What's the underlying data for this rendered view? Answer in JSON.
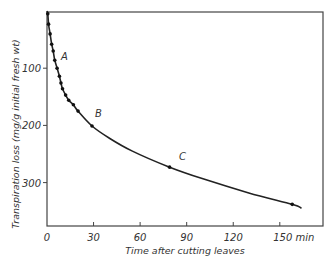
{
  "chart_data": {
    "type": "line",
    "title": "",
    "xlabel": "Time after cutting leaves",
    "ylabel": "Transpiration loss (mg/g  initial fresh wt)",
    "x_unit": "min",
    "xlim": [
      0,
      165
    ],
    "ylim": [
      0,
      355
    ],
    "y_inverted": true,
    "grid": false,
    "legend": null,
    "x_ticks": [
      0,
      30,
      60,
      90,
      120,
      150
    ],
    "x_tick_labels": [
      "0",
      "30",
      "60",
      "90",
      "120",
      "150 min"
    ],
    "y_ticks": [
      100,
      200,
      300
    ],
    "y_tick_labels": [
      "100",
      "200",
      "300"
    ],
    "series": [
      {
        "name": "Transpiration loss",
        "x": [
          0,
          0.5,
          1,
          2,
          3,
          4,
          5,
          6.5,
          8,
          9,
          10,
          12,
          14,
          17,
          20,
          29,
          40,
          55,
          79,
          100,
          130,
          158,
          164
        ],
        "y": [
          0,
          5,
          23,
          40,
          58,
          70,
          86,
          100,
          114,
          126,
          136,
          147,
          156,
          164,
          175,
          201,
          222,
          245,
          273,
          293,
          318,
          338,
          345
        ],
        "markers_x": [
          0.5,
          1,
          2,
          3,
          4,
          5,
          6.5,
          8,
          9,
          10,
          12,
          14,
          17,
          20,
          29,
          79,
          158
        ],
        "markers_y": [
          5,
          23,
          40,
          58,
          70,
          86,
          100,
          114,
          126,
          136,
          147,
          156,
          164,
          175,
          201,
          273,
          338
        ]
      }
    ],
    "annotations": [
      {
        "text": "A",
        "x": 9,
        "y": 85
      },
      {
        "text": "B",
        "x": 31,
        "y": 185
      },
      {
        "text": "C",
        "x": 85,
        "y": 260
      }
    ]
  },
  "labels": {
    "x_axis_title": "Time after cutting leaves",
    "y_axis_title": "Transpiration loss  (mg/g   initial  fresh  wt)"
  }
}
